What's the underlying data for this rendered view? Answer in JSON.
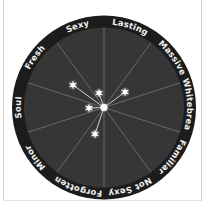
{
  "diagram": {
    "type": "radial-star-map",
    "colors": {
      "ring": "#1c1c1c",
      "disc": "#363636",
      "spoke": "#6e6e6e",
      "label": "#f2f2f2",
      "star": "#ffffff",
      "connector": "#cfcfcf"
    },
    "labels": [
      {
        "text": "Sexy",
        "angle": -18
      },
      {
        "text": "Lasting",
        "angle": 18
      },
      {
        "text": "Massive",
        "angle": 54
      },
      {
        "text": "Whitebread",
        "angle": 90
      },
      {
        "text": "Familiar",
        "angle": 126
      },
      {
        "text": "Not Sexy",
        "angle": 162
      },
      {
        "text": "Forgotten",
        "angle": 198
      },
      {
        "text": "Minor",
        "angle": 234
      },
      {
        "text": "Soul",
        "angle": 270
      },
      {
        "text": "Fresh",
        "angle": 306
      }
    ],
    "stars": [
      {
        "dx": -31,
        "dy": -22.5
      },
      {
        "dx": -5,
        "dy": -14.5
      },
      {
        "dx": 21,
        "dy": -15.5
      },
      {
        "dx": -15,
        "dy": 0.5
      },
      {
        "dx": -9,
        "dy": 26.5
      }
    ]
  }
}
